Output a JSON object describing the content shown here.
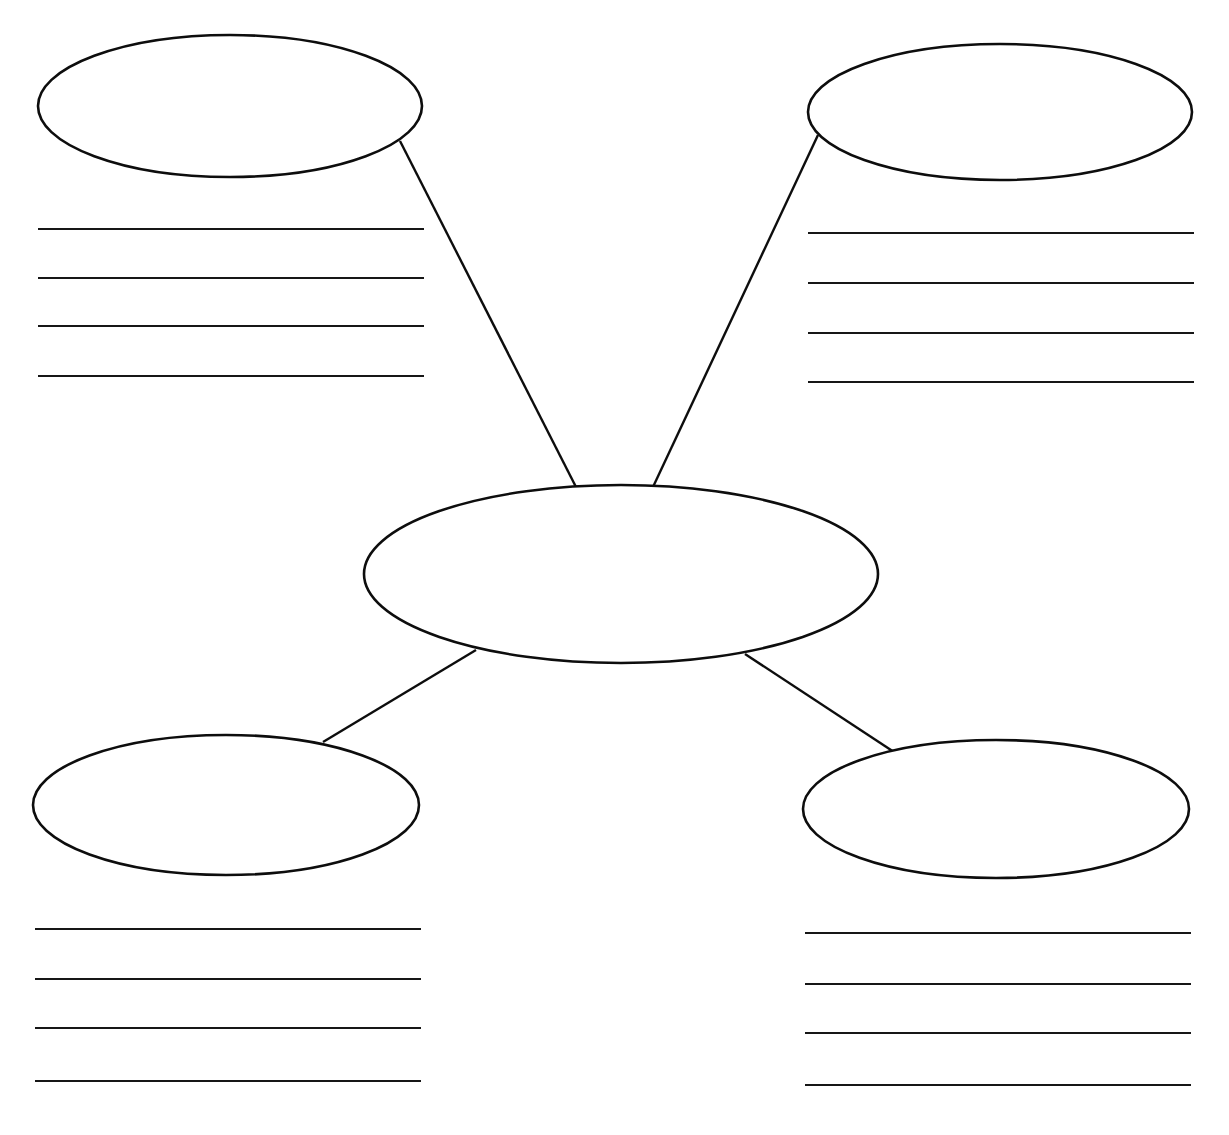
{
  "page": {
    "width": 1229,
    "height": 1135,
    "background_color": "#ffffff",
    "ink_color": "#0d0d0d",
    "line_color": "#161616",
    "orientation": "landscape",
    "is_blank_worksheet": true
  },
  "diagram": {
    "type": "concept-map",
    "layout": "center-node-with-four-branches",
    "node_count": 5,
    "connector_count": 4,
    "writing_block_count": 4,
    "lines_per_writing_block": 4,
    "nodes": [
      {
        "id": "center",
        "name": "center-node",
        "label": "",
        "shape": "ellipse",
        "cx": 621,
        "cy": 574,
        "rx": 257,
        "ry": 89
      },
      {
        "id": "top-left",
        "name": "top-left-node",
        "label": "",
        "shape": "ellipse",
        "cx": 230,
        "cy": 106,
        "rx": 192,
        "ry": 71
      },
      {
        "id": "top-right",
        "name": "top-right-node",
        "label": "",
        "shape": "ellipse",
        "cx": 1000,
        "cy": 112,
        "rx": 192,
        "ry": 68
      },
      {
        "id": "bottom-left",
        "name": "bottom-left-node",
        "label": "",
        "shape": "ellipse",
        "cx": 226,
        "cy": 805,
        "rx": 193,
        "ry": 70
      },
      {
        "id": "bottom-right",
        "name": "bottom-right-node",
        "label": "",
        "shape": "ellipse",
        "cx": 996,
        "cy": 809,
        "rx": 193,
        "ry": 69
      }
    ],
    "connectors": [
      {
        "id": "c1",
        "name": "connector-center-to-top-left",
        "from": "top-left",
        "to": "center",
        "x1": 400,
        "y1": 141,
        "x2": 576,
        "y2": 487
      },
      {
        "id": "c2",
        "name": "connector-center-to-top-right",
        "from": "top-right",
        "to": "center",
        "x1": 818,
        "y1": 135,
        "x2": 653,
        "y2": 487
      },
      {
        "id": "c3",
        "name": "connector-center-to-bottom-left",
        "from": "center",
        "to": "bottom-left",
        "x1": 476,
        "y1": 650,
        "x2": 323,
        "y2": 742
      },
      {
        "id": "c4",
        "name": "connector-center-to-bottom-right",
        "from": "center",
        "to": "bottom-right",
        "x1": 745,
        "y1": 654,
        "x2": 894,
        "y2": 752
      }
    ],
    "writing_blocks": [
      {
        "id": "wb-top-left",
        "name": "writing-lines-top-left",
        "for_node": "top-left",
        "x_start": 38,
        "x_end": 424,
        "line_y": [
          229,
          278,
          326,
          376
        ]
      },
      {
        "id": "wb-top-right",
        "name": "writing-lines-top-right",
        "for_node": "top-right",
        "x_start": 808,
        "x_end": 1194,
        "line_y": [
          233,
          283,
          333,
          382
        ]
      },
      {
        "id": "wb-bottom-left",
        "name": "writing-lines-bottom-left",
        "for_node": "bottom-left",
        "x_start": 35,
        "x_end": 421,
        "line_y": [
          929,
          979,
          1028,
          1081
        ]
      },
      {
        "id": "wb-bottom-right",
        "name": "writing-lines-bottom-right",
        "for_node": "bottom-right",
        "x_start": 805,
        "x_end": 1191,
        "line_y": [
          933,
          984,
          1033,
          1085
        ]
      }
    ]
  }
}
